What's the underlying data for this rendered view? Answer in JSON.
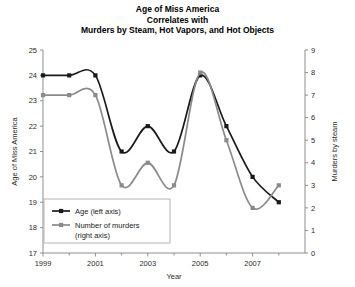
{
  "chart_data": {
    "type": "line",
    "title": "Age of Miss America\nCorrelates with\nMurders by Steam, Hot Vapors, and Hot Objects",
    "title_lines": [
      "Age of Miss America",
      "Correlates with",
      "Murders by Steam, Hot Vapors, and Hot Objects"
    ],
    "xlabel": "Year",
    "ylabel": "Age of Miss America",
    "y2label": "Murders by steam",
    "x": [
      1999,
      2000,
      2001,
      2002,
      2003,
      2004,
      2005,
      2006,
      2007,
      2008
    ],
    "xlim": [
      1999,
      2009
    ],
    "xticks": [
      1999,
      2001,
      2003,
      2005,
      2007
    ],
    "xtick_labels": [
      "1999",
      "2001",
      "2003",
      "2005",
      "2007"
    ],
    "xticks_minor": [
      2000,
      2002,
      2004,
      2006,
      2008
    ],
    "ylim": [
      17,
      25
    ],
    "yticks": [
      17,
      18,
      19,
      20,
      21,
      22,
      23,
      24,
      25
    ],
    "ytick_labels": [
      "17",
      "18",
      "19",
      "20",
      "21",
      "22",
      "23",
      "24",
      "25"
    ],
    "y2lim": [
      0,
      9
    ],
    "y2ticks": [
      0,
      1,
      2,
      3,
      4,
      5,
      6,
      7,
      8,
      9
    ],
    "y2tick_labels": [
      "0",
      "1",
      "2",
      "3",
      "4",
      "5",
      "6",
      "7",
      "8",
      "9"
    ],
    "grid": false,
    "legend_position": "lower left",
    "series": [
      {
        "name": "Age (left axis)",
        "axis": "left",
        "color": "#1a1a1a",
        "marker": "square",
        "values": [
          24,
          24,
          24,
          21,
          22,
          21,
          24,
          22,
          20,
          19
        ]
      },
      {
        "name": "Number of murders (right axis)",
        "axis": "right",
        "color": "#8a8a8a",
        "marker": "square",
        "values": [
          7,
          7,
          7,
          3,
          4,
          3,
          8,
          5,
          2,
          3
        ]
      }
    ],
    "legend_entries": [
      {
        "label": "Age (left axis)",
        "color": "#1a1a1a"
      },
      {
        "label": "Number of murders",
        "label2": "(right axis)",
        "color": "#8a8a8a"
      }
    ]
  }
}
